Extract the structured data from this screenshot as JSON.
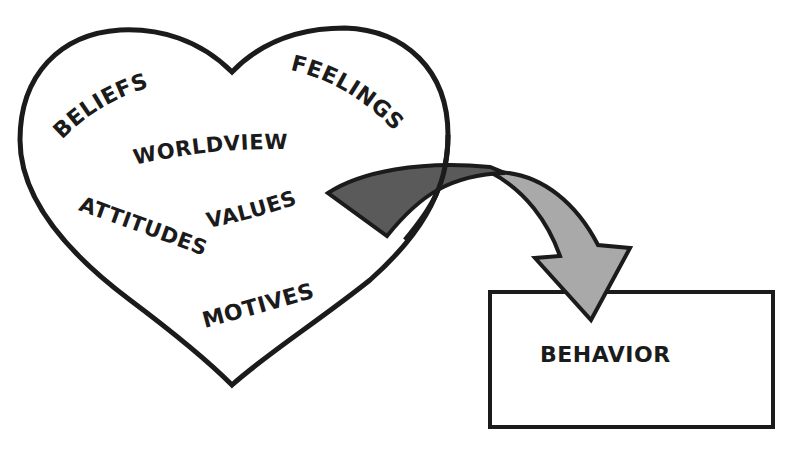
{
  "diagram": {
    "title": "",
    "heart_terms": [
      {
        "id": "beliefs",
        "label": "BELIEFS"
      },
      {
        "id": "feelings",
        "label": "FEELINGS"
      },
      {
        "id": "worldview",
        "label": "WORLDVIEW"
      },
      {
        "id": "values",
        "label": "VALUES"
      },
      {
        "id": "attitudes",
        "label": "ATTITUDES"
      },
      {
        "id": "motives",
        "label": "MOTIVES"
      }
    ],
    "output_box": {
      "label": "BEHAVIOR"
    },
    "colors": {
      "stroke": "#1b1b1b",
      "arrow_tail_fill": "#5a5a5a",
      "arrow_head_fill": "#a9a9a9",
      "background": "#ffffff"
    },
    "relation": "Inner heart contents (values, beliefs, etc.) flow outward via curved arrow into BEHAVIOR"
  }
}
